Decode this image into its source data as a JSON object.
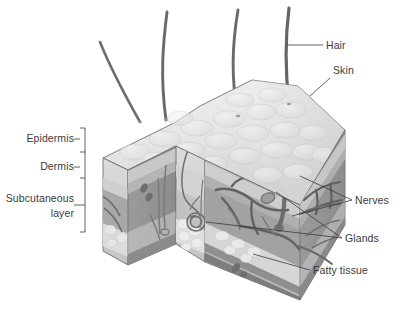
{
  "figure": {
    "type": "anatomical-cutaway-diagram",
    "palette": {
      "background": "#ffffff",
      "epidermis_top": "#e9e9e9",
      "epidermis_band": "#c9c9c9",
      "dermis": "#a9a9a9",
      "dermis_dark": "#8f8f8f",
      "subcutaneous_fat": "#dcdcdc",
      "muscle_band": "#8a8a8a",
      "vessel": "#6b6b6b",
      "hair": "#5c5c5c",
      "outline": "#4a4a4a",
      "label_text": "#3b3b3b",
      "leader_line": "#3b3b3b"
    }
  },
  "labels": {
    "left": [
      {
        "id": "epidermis",
        "text": "Epidermis"
      },
      {
        "id": "dermis",
        "text": "Dermis"
      },
      {
        "id": "subcutaneous",
        "text": "Subcutaneous",
        "text2": "layer"
      }
    ],
    "right": [
      {
        "id": "hair",
        "text": "Hair"
      },
      {
        "id": "skin",
        "text": "Skin"
      },
      {
        "id": "nerves",
        "text": "Nerves"
      },
      {
        "id": "glands",
        "text": "Glands"
      },
      {
        "id": "fatty-tissue",
        "text": "Fatty tissue"
      }
    ]
  },
  "bracket": {
    "ticks": [
      128,
      152,
      178,
      205,
      232
    ],
    "x": 85
  },
  "structures": {
    "hair_strands": 4,
    "layers": [
      "Epidermis",
      "Dermis",
      "Subcutaneous layer"
    ]
  }
}
